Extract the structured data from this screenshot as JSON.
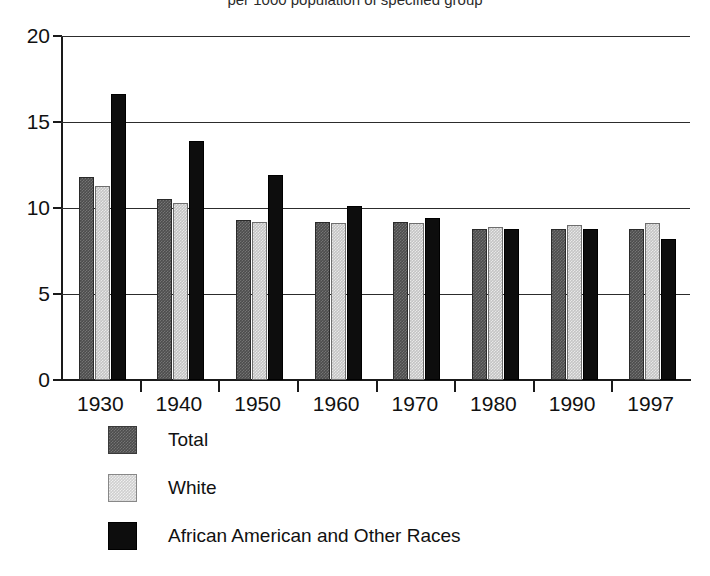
{
  "chart_data": {
    "type": "bar",
    "title": "per 1000 population of specified group",
    "xlabel": "",
    "ylabel": "",
    "ylim": [
      0,
      20
    ],
    "yticks": [
      0,
      5,
      10,
      15,
      20
    ],
    "ytick_labels": [
      "0",
      "5",
      "10",
      "15",
      "20"
    ],
    "grid": true,
    "legend_position": "below-left",
    "categories": [
      "1930",
      "1940",
      "1950",
      "1960",
      "1970",
      "1980",
      "1990",
      "1997"
    ],
    "series": [
      {
        "name": "Total",
        "color": "#4d4d4d",
        "values": [
          11.8,
          10.5,
          9.3,
          9.2,
          9.2,
          8.8,
          8.8,
          8.8
        ]
      },
      {
        "name": "White",
        "color": "#c4c4c4",
        "values": [
          11.3,
          10.3,
          9.2,
          9.1,
          9.1,
          8.9,
          9.0,
          9.1
        ]
      },
      {
        "name": "African American and Other Races",
        "color": "#0d0d0d",
        "values": [
          16.6,
          13.9,
          11.9,
          10.1,
          9.4,
          8.8,
          8.8,
          8.2
        ]
      }
    ]
  },
  "legend": {
    "items": [
      {
        "label": "Total",
        "swatch": "total"
      },
      {
        "label": "White",
        "swatch": "white"
      },
      {
        "label": "African American and Other Races",
        "swatch": "aa"
      }
    ]
  }
}
